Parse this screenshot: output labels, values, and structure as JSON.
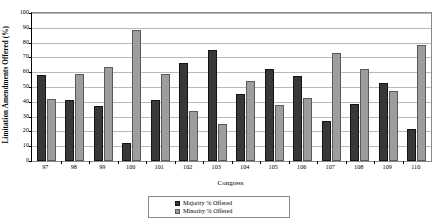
{
  "chart_data": {
    "type": "bar",
    "title": "",
    "xlabel": "Congress",
    "ylabel": "Limitation Amendments Offered (%)",
    "ylim": [
      0,
      100
    ],
    "ytick_step": 10,
    "yticks": [
      0,
      10,
      20,
      30,
      40,
      50,
      60,
      70,
      80,
      90,
      100
    ],
    "ytick_labels": [
      "0",
      "10",
      "20",
      "30",
      "40",
      "50",
      "60",
      "70",
      "80",
      "90",
      "100"
    ],
    "grid": true,
    "grid_axis": "y",
    "legend_position": "bottom-center",
    "categories": [
      "97",
      "98",
      "99",
      "100",
      "101",
      "102",
      "103",
      "104",
      "105",
      "106",
      "107",
      "108",
      "109",
      "110"
    ],
    "series": [
      {
        "name": "Majority % Offered",
        "color": "#383838",
        "values": [
          58,
          41.5,
          37,
          12,
          41.5,
          66.5,
          75,
          45.5,
          62,
          57.5,
          27,
          38.5,
          52.5,
          21.5
        ]
      },
      {
        "name": "Minority % Offered",
        "color": "#9d9d9d",
        "values": [
          42,
          58.5,
          63.5,
          88.5,
          58.5,
          33.5,
          25,
          54,
          38,
          42.5,
          73,
          62,
          47.5,
          78.5
        ]
      }
    ]
  }
}
